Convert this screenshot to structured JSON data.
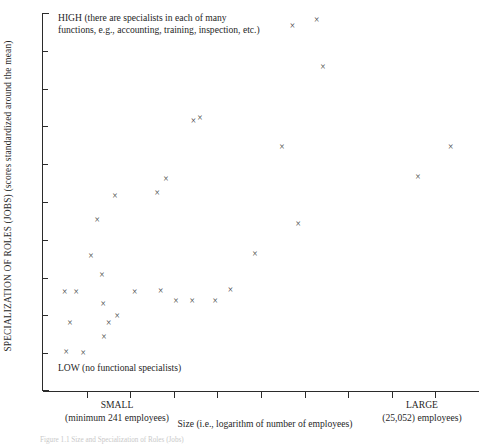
{
  "figure": {
    "annotation_high": "HIGH (there are specialists in each of many",
    "annotation_high_line2": "functions, e.g., accounting, training, inspection, etc.)",
    "annotation_low": "LOW (no functional specialists)",
    "caption": "Figure 1.1  Size and Specialization of Roles (Jobs)"
  },
  "yaxis": {
    "title": "SPECIALIZATION OF ROLES (JOBS)  (scores standardized around the mean)",
    "title_caps": "SPECIALIZATION OF ROLES (JOBS)",
    "title_lower": "(scores standardized around the mean)",
    "tick_count": 9
  },
  "xaxis": {
    "title": "Size (i.e., logarithm of number of employees)",
    "label_small": "SMALL",
    "label_small_sub": "(minimum 241 employees)",
    "label_large": "LARGE",
    "label_large_sub": "(25,052) employees)",
    "tick_count": 9
  },
  "colors": {
    "axis": "#2b2b2b",
    "marker": "#3a3a3a",
    "text": "#1f1f1f",
    "background": "#ffffff"
  },
  "chart_data": {
    "type": "scatter",
    "title": "",
    "xlabel": "Size (i.e., logarithm of number of employees)",
    "ylabel": "SPECIALIZATION OF ROLES (JOBS) (scores standardized around the mean)",
    "xlim": [
      0,
      100
    ],
    "ylim": [
      0,
      100
    ],
    "grid": false,
    "legend": false,
    "marker_symbol": "×",
    "x_tick_labels": [
      "",
      "SMALL",
      "",
      "",
      "",
      "",
      "",
      "",
      "LARGE",
      ""
    ],
    "x_annotations": [
      {
        "x": 11,
        "label": "SMALL",
        "sublabel": "(minimum 241 employees)"
      },
      {
        "x": 88,
        "label": "LARGE",
        "sublabel": "(25,052) employees)"
      }
    ],
    "y_annotations": [
      {
        "y": 98,
        "label": "HIGH (there are specialists in each of many functions, e.g., accounting, training, inspection, etc.)"
      },
      {
        "y": 7,
        "label": "LOW (no functional specialists)"
      }
    ],
    "points": [
      {
        "x": 5.0,
        "y": 26.2
      },
      {
        "x": 7.6,
        "y": 26.2
      },
      {
        "x": 6.2,
        "y": 18.0
      },
      {
        "x": 5.3,
        "y": 10.3
      },
      {
        "x": 9.2,
        "y": 10.0
      },
      {
        "x": 12.4,
        "y": 45.0
      },
      {
        "x": 11.0,
        "y": 35.5
      },
      {
        "x": 13.5,
        "y": 30.5
      },
      {
        "x": 13.8,
        "y": 22.8
      },
      {
        "x": 15.1,
        "y": 18.0
      },
      {
        "x": 14.0,
        "y": 14.2
      },
      {
        "x": 17.0,
        "y": 19.8
      },
      {
        "x": 16.5,
        "y": 51.5
      },
      {
        "x": 21.0,
        "y": 26.0
      },
      {
        "x": 28.2,
        "y": 56.0
      },
      {
        "x": 26.2,
        "y": 52.3
      },
      {
        "x": 27.0,
        "y": 26.3
      },
      {
        "x": 30.5,
        "y": 23.8
      },
      {
        "x": 34.2,
        "y": 23.8
      },
      {
        "x": 39.5,
        "y": 23.8
      },
      {
        "x": 36.0,
        "y": 72.0
      },
      {
        "x": 34.5,
        "y": 71.3
      },
      {
        "x": 43.0,
        "y": 26.5
      },
      {
        "x": 48.6,
        "y": 36.0
      },
      {
        "x": 54.8,
        "y": 64.3
      },
      {
        "x": 57.2,
        "y": 96.5
      },
      {
        "x": 62.8,
        "y": 98.0
      },
      {
        "x": 58.5,
        "y": 44.0
      },
      {
        "x": 64.2,
        "y": 85.5
      },
      {
        "x": 86.0,
        "y": 56.5
      },
      {
        "x": 93.5,
        "y": 64.5
      }
    ]
  }
}
